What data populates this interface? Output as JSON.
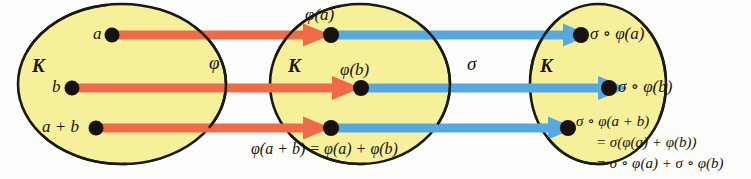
{
  "figure": {
    "background_color": "#fdfdfb",
    "set_fill_color": "#f6f09b",
    "set_stroke_color": "#1a1a14",
    "arrow_color_phi": "#ef6a47",
    "arrow_color_sigma": "#56a9e0",
    "text_color": "#18140f"
  },
  "sets": {
    "left": {
      "label": "K"
    },
    "middle": {
      "label": "K"
    },
    "right": {
      "label": "K"
    }
  },
  "maps": {
    "phi": {
      "label": "φ",
      "color": "#ef6a47"
    },
    "sigma": {
      "label": "σ",
      "color": "#56a9e0"
    }
  },
  "elements": {
    "left": [
      {
        "label": "a"
      },
      {
        "label": "b"
      },
      {
        "label": "a + b"
      }
    ],
    "middle": [
      {
        "label": "φ(a)"
      },
      {
        "label": "φ(b)"
      }
    ],
    "right": [
      {
        "label": "σ ∘ φ(a)"
      },
      {
        "label": "σ ∘ φ(b)"
      }
    ]
  },
  "equations": {
    "middle_bottom": "φ(a + b) = φ(a) + φ(b)",
    "right_line1": "σ ∘ φ(a + b)",
    "right_line2": "= σ(φ(a) + φ(b))",
    "right_line3": "= σ ∘ φ(a) + σ ∘ φ(b)"
  }
}
